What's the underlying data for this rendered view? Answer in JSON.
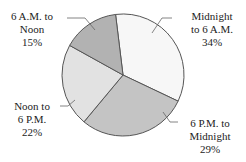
{
  "chart_data": {
    "type": "pie",
    "title": "",
    "slices": [
      {
        "label": "Midnight to 6 A.M.",
        "line1": "Midnight",
        "line2": "to 6 A.M.",
        "value": 34,
        "pct": "34%",
        "color": "#f7f7f7"
      },
      {
        "label": "6 P.M. to Midnight",
        "line1": "6 P.M. to",
        "line2": "Midnight",
        "value": 29,
        "pct": "29%",
        "color": "#c4c4c4"
      },
      {
        "label": "Noon to 6 P.M.",
        "line1": "Noon to",
        "line2": "6 P.M.",
        "value": 22,
        "pct": "22%",
        "color": "#e2e2e2"
      },
      {
        "label": "6 A.M. to Noon",
        "line1": "6 A.M. to",
        "line2": "Noon",
        "value": 15,
        "pct": "15%",
        "color": "#b2b2b2"
      }
    ],
    "start_angle_deg": -7,
    "direction": "clockwise",
    "stroke": "#555555"
  }
}
